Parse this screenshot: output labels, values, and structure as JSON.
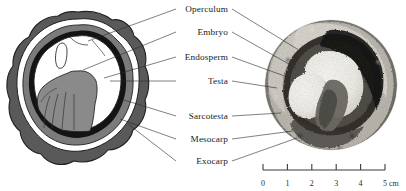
{
  "figure": {
    "background_color": "#ffffff"
  },
  "labels": [
    {
      "id": "operculum",
      "text": "Operculum",
      "x": 228,
      "y": 12
    },
    {
      "id": "embryo",
      "text": "Embryo",
      "x": 228,
      "y": 35
    },
    {
      "id": "endosperm",
      "text": "Endosperm",
      "x": 228,
      "y": 60
    },
    {
      "id": "testa",
      "text": "Testa",
      "x": 228,
      "y": 84
    },
    {
      "id": "sarcotesta",
      "text": "Sarcotesta",
      "x": 228,
      "y": 119
    },
    {
      "id": "mesocarp",
      "text": "Mesocarp",
      "x": 228,
      "y": 142
    },
    {
      "id": "exocarp",
      "text": "Exocarp",
      "x": 228,
      "y": 164
    }
  ],
  "leaders_left": [
    {
      "id": "operculum-leader-left",
      "x1": 176,
      "y1": 9,
      "x2": 88,
      "y2": 41
    },
    {
      "id": "embryo-leader-left",
      "x1": 176,
      "y1": 32,
      "x2": 83,
      "y2": 70
    },
    {
      "id": "endosperm-leader-left",
      "x1": 176,
      "y1": 57,
      "x2": 104,
      "y2": 78
    },
    {
      "id": "testa-leader-left",
      "x1": 176,
      "y1": 81,
      "x2": 110,
      "y2": 81
    },
    {
      "id": "sarcotesta-leader-left",
      "x1": 176,
      "y1": 116,
      "x2": 124,
      "y2": 100
    },
    {
      "id": "mesocarp-leader-left",
      "x1": 176,
      "y1": 139,
      "x2": 120,
      "y2": 119
    },
    {
      "id": "exocarp-leader-left",
      "x1": 176,
      "y1": 161,
      "x2": 128,
      "y2": 124
    }
  ],
  "leaders_right": [
    {
      "id": "operculum-leader-right",
      "x1": 232,
      "y1": 9,
      "x2": 302,
      "y2": 52
    },
    {
      "id": "embryo-leader-right",
      "x1": 232,
      "y1": 32,
      "x2": 296,
      "y2": 68
    },
    {
      "id": "endosperm-leader-right",
      "x1": 232,
      "y1": 57,
      "x2": 290,
      "y2": 78
    },
    {
      "id": "testa-leader-right",
      "x1": 232,
      "y1": 81,
      "x2": 277,
      "y2": 88
    },
    {
      "id": "sarcotesta-leader-right",
      "x1": 232,
      "y1": 116,
      "x2": 281,
      "y2": 113
    },
    {
      "id": "mesocarp-leader-right",
      "x1": 232,
      "y1": 139,
      "x2": 293,
      "y2": 131
    },
    {
      "id": "exocarp-leader-right",
      "x1": 232,
      "y1": 161,
      "x2": 297,
      "y2": 138
    }
  ],
  "scale_bar": {
    "unit": "cm",
    "ticks": [
      "0",
      "1",
      "2",
      "3",
      "4",
      "5"
    ],
    "x_start": 263,
    "x_end": 385,
    "y_axis": 170,
    "tick_height": 6,
    "label_y": 186
  },
  "colors": {
    "exocarp": "#595959",
    "mesocarp": "#ffffff",
    "sarcotesta": "#7b7b7b",
    "testa": "#141414",
    "endosperm": "#ffffff",
    "embryo": "#8a8a8a",
    "operculum": "#ffffff",
    "outline": "#1a1a1a",
    "photo_dark": "#1d1d1d",
    "photo_mid": "#8d8d8d",
    "photo_light": "#e6e4df"
  },
  "panels": {
    "diagram": {
      "name": "schematic-seed-cross-section",
      "cx": 78,
      "cy": 95
    },
    "photograph": {
      "name": "photographic-seed-cross-section",
      "cx": 330,
      "cy": 85
    }
  }
}
